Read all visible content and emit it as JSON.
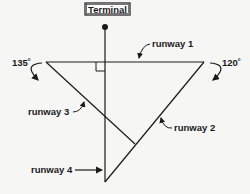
{
  "terminal": {
    "label": "Terminal"
  },
  "runways": [
    {
      "id": "runway-1",
      "label": "runway 1"
    },
    {
      "id": "runway-2",
      "label": "runway 2"
    },
    {
      "id": "runway-3",
      "label": "runway 3"
    },
    {
      "id": "runway-4",
      "label": "runway 4"
    }
  ],
  "angles": {
    "left": "135˚",
    "right": "120˚"
  },
  "colors": {
    "stroke": "#1a1a1a",
    "background": "#f6f6f4"
  }
}
